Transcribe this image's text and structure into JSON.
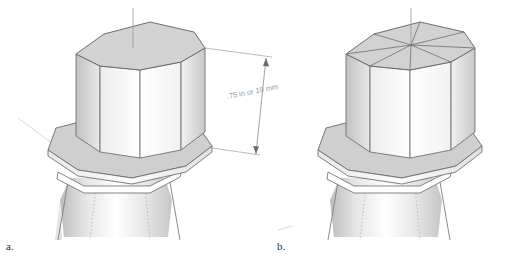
{
  "figure": {
    "background_color": "#ffffff",
    "line_color": "#555555",
    "hidden_line_color": "#9a9a9a",
    "top_face_color": "#d2d2d2",
    "flange_face_color": "#cfcfcf",
    "side_light_color": "#ffffff",
    "side_dark_color": "#c4c4c4",
    "dimension_color": "#8e8e8e",
    "panels": [
      {
        "id": "a",
        "caption": "a.",
        "description": "Octagonal tenon on flanged tapered post, top face plain",
        "top_face_style": "plain",
        "has_dimension": true
      },
      {
        "id": "b",
        "caption": "b.",
        "description": "Octagonal tenon on flanged tapered post, top face with radial spokes",
        "top_face_style": "radial-spokes",
        "spoke_count": 8,
        "has_dimension": false
      }
    ]
  },
  "annotations": {
    "dimension": {
      "label": ".75 in or 19 mm",
      "imperial_value": ".75 in",
      "metric_value": "19 mm",
      "orientation": "vertical",
      "text_rotation_degrees": -12,
      "arrowheads": "both-ends"
    }
  },
  "captions": {
    "a": "a.",
    "b": "b."
  }
}
